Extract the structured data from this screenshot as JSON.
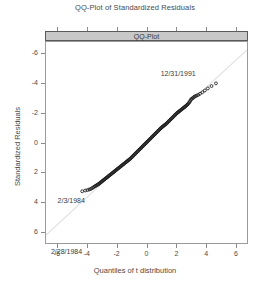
{
  "title": "QQ-Plot of Standardized Residuals",
  "strip": {
    "label": "QQ-Plot"
  },
  "axes": {
    "xlabel": "Quantiles of t distribution",
    "ylabel": "Standardized Residuals",
    "xticks": [
      "-6",
      "-4",
      "-2",
      "0",
      "2",
      "4",
      "6"
    ],
    "yticks": [
      "6",
      "4",
      "2",
      "0",
      "-2",
      "-4",
      "-6"
    ]
  },
  "annotations": {
    "upper_right": "12/31/1991",
    "lower_left": "2/3/1984",
    "bottom_left": "2/28/1984"
  },
  "colors": {
    "strip_fill": "#c8c8c8",
    "frame": "#9a9a9a",
    "point": "#1a1a1a",
    "refline": "#e2e2e2",
    "text": "#4a4a4a"
  },
  "chart_data": {
    "type": "scatter",
    "title": "QQ-Plot of Standardized Residuals",
    "xlabel": "Quantiles of t distribution",
    "ylabel": "Standardized Residuals",
    "xlim": [
      -6.8,
      6.8
    ],
    "ylim": [
      -6.8,
      6.8
    ],
    "xticks": [
      -6,
      -4,
      -2,
      0,
      2,
      4,
      6
    ],
    "yticks": [
      -6,
      -4,
      -2,
      0,
      2,
      4,
      6
    ],
    "grid": false,
    "legend": "none",
    "reference_line": {
      "intercept": 0,
      "slope": 0.92,
      "style": "solid",
      "color": "#e2e2e2"
    },
    "series": [
      {
        "name": "Standardized residuals vs t quantiles",
        "marker": "open-circle",
        "x": [
          -4.35,
          -4.15,
          -4.0,
          -3.88,
          -3.78,
          -3.7,
          -3.62,
          -3.55,
          -3.48,
          -3.42,
          -3.36,
          -3.3,
          -3.25,
          -3.2,
          -3.15,
          -3.1,
          -3.05,
          -3.0,
          -2.95,
          -2.9,
          -2.85,
          -2.8,
          -2.75,
          -2.7,
          -2.65,
          -2.6,
          -2.55,
          -2.5,
          -2.45,
          -2.4,
          -2.35,
          -2.3,
          -2.25,
          -2.2,
          -2.15,
          -2.1,
          -2.05,
          -2.0,
          -1.95,
          -1.9,
          -1.85,
          -1.8,
          -1.75,
          -1.7,
          -1.65,
          -1.6,
          -1.55,
          -1.5,
          -1.45,
          -1.4,
          -1.35,
          -1.3,
          -1.25,
          -1.2,
          -1.15,
          -1.1,
          -1.05,
          -1.0,
          -0.95,
          -0.9,
          -0.85,
          -0.8,
          -0.75,
          -0.7,
          -0.65,
          -0.6,
          -0.55,
          -0.5,
          -0.45,
          -0.4,
          -0.35,
          -0.3,
          -0.25,
          -0.2,
          -0.15,
          -0.1,
          -0.05,
          0.0,
          0.05,
          0.1,
          0.15,
          0.2,
          0.25,
          0.3,
          0.35,
          0.4,
          0.45,
          0.5,
          0.55,
          0.6,
          0.65,
          0.7,
          0.75,
          0.8,
          0.85,
          0.9,
          0.95,
          1.0,
          1.05,
          1.1,
          1.15,
          1.2,
          1.25,
          1.3,
          1.35,
          1.4,
          1.45,
          1.5,
          1.55,
          1.6,
          1.65,
          1.7,
          1.75,
          1.8,
          1.85,
          1.9,
          1.95,
          2.0,
          2.05,
          2.1,
          2.15,
          2.2,
          2.25,
          2.3,
          2.35,
          2.4,
          2.45,
          2.5,
          2.55,
          2.6,
          2.65,
          2.7,
          2.75,
          2.8,
          2.85,
          2.9,
          2.95,
          3.0,
          3.06,
          3.12,
          3.18,
          3.25,
          3.32,
          3.4,
          3.5,
          3.62,
          3.78,
          3.95,
          4.15,
          4.4,
          4.7
        ],
        "y": [
          -3.3,
          -3.25,
          -3.22,
          -3.18,
          -3.15,
          -3.1,
          -3.05,
          -3.0,
          -2.96,
          -2.92,
          -2.88,
          -2.85,
          -2.82,
          -2.78,
          -2.74,
          -2.7,
          -2.66,
          -2.62,
          -2.58,
          -2.54,
          -2.5,
          -2.46,
          -2.42,
          -2.38,
          -2.34,
          -2.3,
          -2.26,
          -2.22,
          -2.18,
          -2.14,
          -2.1,
          -2.06,
          -2.02,
          -1.98,
          -1.94,
          -1.9,
          -1.86,
          -1.82,
          -1.78,
          -1.74,
          -1.7,
          -1.66,
          -1.62,
          -1.58,
          -1.54,
          -1.5,
          -1.46,
          -1.42,
          -1.38,
          -1.34,
          -1.3,
          -1.26,
          -1.22,
          -1.18,
          -1.14,
          -1.1,
          -1.05,
          -1.0,
          -0.95,
          -0.9,
          -0.85,
          -0.8,
          -0.75,
          -0.7,
          -0.65,
          -0.6,
          -0.55,
          -0.5,
          -0.45,
          -0.4,
          -0.35,
          -0.3,
          -0.25,
          -0.2,
          -0.15,
          -0.1,
          -0.05,
          0.0,
          0.05,
          0.1,
          0.15,
          0.2,
          0.25,
          0.3,
          0.35,
          0.4,
          0.45,
          0.5,
          0.55,
          0.6,
          0.65,
          0.7,
          0.75,
          0.8,
          0.85,
          0.9,
          0.95,
          1.0,
          1.04,
          1.08,
          1.12,
          1.16,
          1.2,
          1.24,
          1.28,
          1.33,
          1.38,
          1.43,
          1.48,
          1.53,
          1.58,
          1.63,
          1.68,
          1.73,
          1.78,
          1.83,
          1.88,
          1.93,
          1.98,
          2.02,
          2.06,
          2.1,
          2.14,
          2.18,
          2.22,
          2.26,
          2.3,
          2.34,
          2.38,
          2.42,
          2.46,
          2.5,
          2.55,
          2.6,
          2.66,
          2.72,
          2.8,
          2.9,
          2.95,
          3.0,
          3.05,
          3.1,
          3.14,
          3.18,
          3.22,
          3.3,
          3.4,
          3.52,
          3.66,
          3.82,
          4.0
        ]
      }
    ],
    "annotations": [
      {
        "text": "12/31/1991",
        "x": 4.7,
        "y": 4.0,
        "position": "left-of-point"
      },
      {
        "text": "2/3/1984",
        "x": -4.35,
        "y": -3.3,
        "position": "below-left"
      },
      {
        "text": "2/28/1984",
        "x": -6.0,
        "y": -6.7,
        "position": "below-left"
      }
    ]
  }
}
